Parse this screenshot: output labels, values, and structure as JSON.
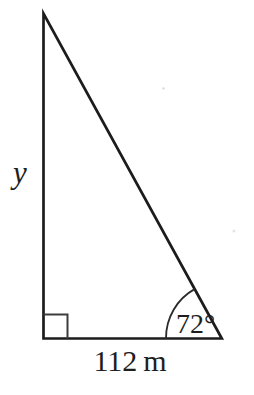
{
  "figure": {
    "type": "right-triangle-trigonometry-diagram",
    "triangle": {
      "vertical_side_label": "y",
      "base_label": "112 m",
      "angle_label": "72°",
      "angle_degrees": 72,
      "base_length_meters": 112,
      "right_angle_marker": true
    },
    "colors": {
      "line": "#1c1c1c",
      "marker": "#3d3d3d",
      "text": "#1e1e1e",
      "background": "#ffffff"
    }
  }
}
